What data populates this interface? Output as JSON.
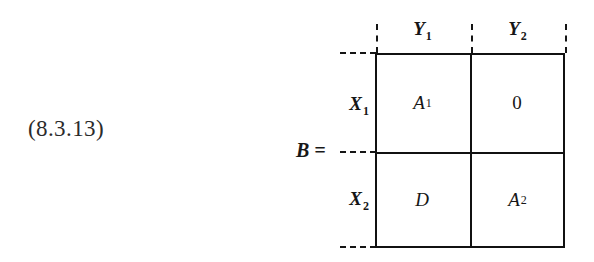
{
  "equation": {
    "number": "(8.3.13)",
    "lhs": "B ="
  },
  "matrix": {
    "column_headers": [
      {
        "base": "Y",
        "sub": "1"
      },
      {
        "base": "Y",
        "sub": "2"
      }
    ],
    "row_headers": [
      {
        "base": "X",
        "sub": "1"
      },
      {
        "base": "X",
        "sub": "2"
      }
    ],
    "cells": [
      [
        {
          "base": "A",
          "sup": "1"
        },
        {
          "base": "0",
          "sup": ""
        }
      ],
      [
        {
          "base": "D",
          "sup": ""
        },
        {
          "base": "A",
          "sup": "2"
        }
      ]
    ]
  },
  "style": {
    "rule_color": "#111111",
    "text_color": "#161616",
    "background": "#ffffff"
  }
}
